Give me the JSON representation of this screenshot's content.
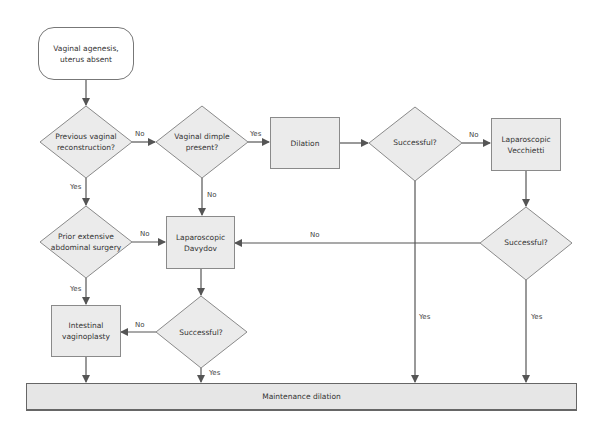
{
  "nodes": {
    "start": "Vaginal agenesis, uterus absent",
    "start_line1": "Vaginal agenesis,",
    "start_line2": "uterus absent",
    "prev_reconstruction": {
      "line1": "Previous vaginal",
      "line2": "reconstruction?"
    },
    "dimple": {
      "line1": "Vaginal dimple",
      "line2": "present?"
    },
    "dilation": "Dilation",
    "dilation_success": "Successful?",
    "vecchietti": {
      "line1": "Laparoscopic",
      "line2": "Vecchietti"
    },
    "vecchietti_success": "Successful?",
    "prior_surgery": {
      "line1": "Prior extensive",
      "line2": "abdominal surgery"
    },
    "davydov": {
      "line1": "Laparoscopic",
      "line2": "Davydov"
    },
    "davydov_success": "Successful?",
    "intestinal": {
      "line1": "Intestinal",
      "line2": "vaginoplasty"
    },
    "maintenance": "Maintenance dilation"
  },
  "edges": {
    "prev_no": "No",
    "prev_yes": "Yes",
    "dimple_yes": "Yes",
    "dimple_no": "No",
    "dilation_success_no": "No",
    "dilation_success_yes": "Yes",
    "vecchietti_success_no": "No",
    "vecchietti_success_yes": "Yes",
    "prior_no": "No",
    "prior_yes": "Yes",
    "davydov_success_no": "No",
    "davydov_success_yes": "Yes"
  },
  "colors": {
    "fill": "#ebebeb",
    "stroke": "#8a8a8a",
    "arrow": "#555555"
  }
}
